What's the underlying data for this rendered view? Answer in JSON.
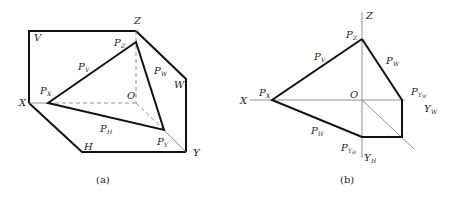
{
  "figure_a": {
    "caption": "(a)",
    "labels": {
      "V": "V",
      "Z": "Z",
      "X": "X",
      "W": "W",
      "H": "H",
      "Y": "Y",
      "O": "O",
      "P": "P",
      "sub_Z": "Z",
      "sub_V": "V",
      "sub_X": "X",
      "sub_W": "W",
      "sub_H": "H",
      "sub_Y": "Y"
    }
  },
  "figure_b": {
    "caption": "(b)",
    "labels": {
      "Z": "Z",
      "X": "X",
      "O": "O",
      "Y": "Y",
      "P": "P",
      "sub_Z": "Z",
      "sub_V": "V",
      "sub_X": "X",
      "sub_W": "W",
      "sub_H": "H",
      "sub_Y": "Y",
      "sub_W_small": "W",
      "sub_H_small": "H"
    }
  }
}
